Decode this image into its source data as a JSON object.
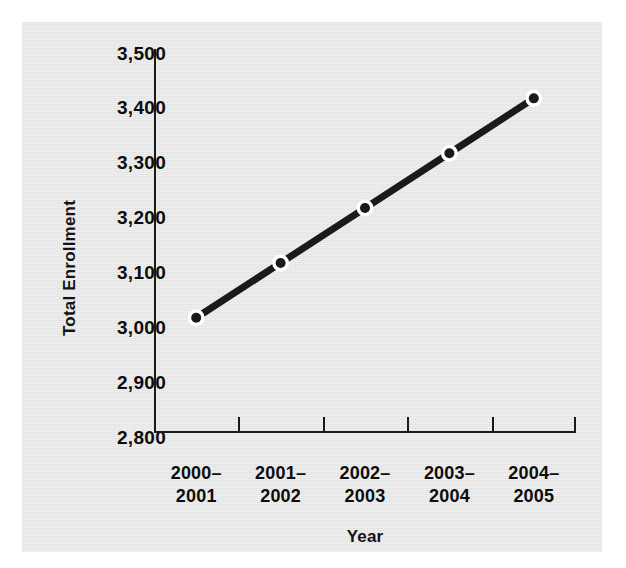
{
  "chart_data": {
    "type": "line",
    "title": "",
    "xlabel": "Year",
    "ylabel": "Total Enrollment",
    "categories": [
      "2000–2001",
      "2001–2002",
      "2002–2003",
      "2003–2004",
      "2004–2005"
    ],
    "category_lines": [
      [
        "2000–",
        "2001"
      ],
      [
        "2001–",
        "2002"
      ],
      [
        "2002–",
        "2003"
      ],
      [
        "2003–",
        "2004"
      ],
      [
        "2004–",
        "2005"
      ]
    ],
    "values": [
      3010,
      3110,
      3210,
      3310,
      3410
    ],
    "series": [
      {
        "name": "Total Enrollment",
        "values": [
          3010,
          3110,
          3210,
          3310,
          3410
        ],
        "color": "#1a1a1a",
        "marker": "circle-white-ring"
      }
    ],
    "ylim": [
      2800,
      3500
    ],
    "ytick_values": [
      3500,
      3400,
      3300,
      3200,
      3100,
      3000,
      2900,
      2800
    ],
    "ytick_labels": [
      "3,500",
      "3,400",
      "3,300",
      "3,200",
      "3,100",
      "3,000",
      "2,900",
      "2,800"
    ],
    "ystep": 100,
    "grid": false,
    "legend": "none"
  },
  "colors": {
    "background": "#ffffff",
    "card": "#e6e6e6",
    "axis": "#1a1a1a",
    "line": "#1a1a1a",
    "marker_ring": "#ffffff",
    "text": "#0d0d0d"
  }
}
